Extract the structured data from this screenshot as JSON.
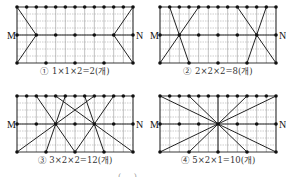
{
  "figure": {
    "grid": {
      "columns": 12,
      "rows": 6,
      "fine_rows": 8
    },
    "point_rows": {
      "top": [
        0,
        1,
        2,
        3,
        4,
        5,
        6,
        7,
        8,
        9,
        10,
        11,
        12
      ],
      "middle": [
        0,
        2,
        4,
        6,
        8,
        10,
        12
      ],
      "bottom": [
        0,
        3,
        6,
        9,
        12
      ]
    },
    "endpoint_labels": {
      "left": "M",
      "right": "N"
    },
    "colors": {
      "line": "#222222",
      "grid": "#9a9a9a",
      "dot": "#111111"
    },
    "panels": [
      {
        "id": 1,
        "caption": "① 1×1×2=2(개)",
        "lines": [
          [
            0,
            2
          ],
          [
            2,
            0
          ],
          [
            12,
            10
          ],
          [
            10,
            12
          ]
        ],
        "line_mode": "top-mid-bottom",
        "segments": [
          {
            "top": 0,
            "mid": 2,
            "bottom": 0
          },
          {
            "top": 12,
            "mid": 10,
            "bottom": 12
          }
        ]
      },
      {
        "id": 2,
        "caption": "② 2×2×2=8(개)",
        "segments": [
          {
            "top": 1,
            "bottom": 3
          },
          {
            "top": 4,
            "bottom": 0
          },
          {
            "top": 8,
            "bottom": 12
          },
          {
            "top": 11,
            "bottom": 9
          }
        ]
      },
      {
        "id": 3,
        "caption": "③ 3×2×2=12(개)",
        "segments": [
          {
            "top": 2,
            "bottom": 6
          },
          {
            "top": 5,
            "bottom": 3
          },
          {
            "top": 8,
            "bottom": 0
          },
          {
            "top": 4,
            "bottom": 12
          },
          {
            "top": 7,
            "bottom": 9
          },
          {
            "top": 10,
            "bottom": 6
          }
        ]
      },
      {
        "id": 4,
        "caption": "④ 5×2×1=10(개)",
        "segments": [
          {
            "top": 0,
            "bottom": 12
          },
          {
            "top": 3,
            "bottom": 9
          },
          {
            "top": 6,
            "bottom": 6
          },
          {
            "top": 9,
            "bottom": 3
          },
          {
            "top": 12,
            "bottom": 0
          }
        ]
      }
    ],
    "bottom_fragment": "( . . )"
  }
}
